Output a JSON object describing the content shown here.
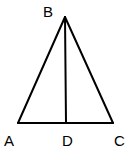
{
  "diagram": {
    "type": "geometry-triangle",
    "stroke_color": "#000000",
    "background": "#ffffff",
    "points": {
      "A": {
        "label": "A",
        "x": 18,
        "y": 123,
        "lx": 4,
        "ly": 146
      },
      "B": {
        "label": "B",
        "x": 65,
        "y": 17,
        "lx": 43,
        "ly": 17
      },
      "C": {
        "label": "C",
        "x": 113,
        "y": 123,
        "lx": 114,
        "ly": 146
      },
      "D": {
        "label": "D",
        "x": 66,
        "y": 123,
        "lx": 62,
        "ly": 146
      }
    },
    "segments": [
      "AB",
      "BC",
      "AC",
      "BD"
    ]
  }
}
